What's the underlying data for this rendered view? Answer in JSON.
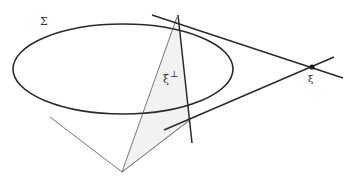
{
  "diagram": {
    "labels": {
      "surface": "Σ",
      "polar": "ξ",
      "polar_superscript": "⊥",
      "point": "ξ"
    },
    "colors": {
      "stroke": "#2a2a2a",
      "thin_stroke": "#555555",
      "shade": "#f2f2f2",
      "background": "#ffffff"
    },
    "elements": [
      "ellipse Σ",
      "tangent lines from point ξ",
      "polar line ξ⊥",
      "cone from vertex to ellipse",
      "shaded triangle region"
    ]
  }
}
